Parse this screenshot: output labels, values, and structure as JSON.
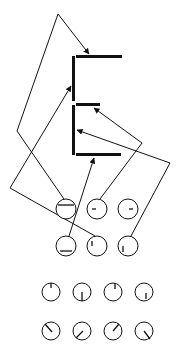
{
  "diagram": {
    "background": "#ffffff",
    "stroke_color": "#111111",
    "glyph": {
      "name": "E-shape",
      "vertical_bars": [
        {
          "x": 73.5,
          "y1": 56,
          "y2": 101
        },
        {
          "x": 73.5,
          "y1": 105,
          "y2": 155
        }
      ],
      "horizontal_bars": [
        {
          "y": 56.5,
          "x1": 76,
          "x2": 122
        },
        {
          "y": 104.5,
          "x1": 76,
          "x2": 100
        },
        {
          "y": 154.5,
          "x1": 76,
          "x2": 121
        }
      ]
    },
    "circle_rows": [
      {
        "r": 10,
        "circles": [
          {
            "cx": 66,
            "cy": 209,
            "mark": {
              "x1": 58,
              "y1": 205,
              "x2": 74,
              "y2": 205
            }
          },
          {
            "cx": 97,
            "cy": 209,
            "mark": {
              "x1": 92,
              "y1": 209,
              "x2": 96,
              "y2": 209
            }
          },
          {
            "cx": 128,
            "cy": 209,
            "mark": {
              "x1": 129,
              "y1": 209,
              "x2": 133,
              "y2": 209
            }
          }
        ]
      },
      {
        "r": 10,
        "circles": [
          {
            "cx": 66,
            "cy": 246,
            "mark": {
              "x1": 60,
              "y1": 251,
              "x2": 72,
              "y2": 251
            }
          },
          {
            "cx": 97,
            "cy": 246,
            "mark": {
              "x1": 92,
              "y1": 241,
              "x2": 92,
              "y2": 246
            }
          },
          {
            "cx": 128,
            "cy": 246,
            "mark": {
              "x1": 123,
              "y1": 246,
              "x2": 123,
              "y2": 252
            }
          }
        ]
      },
      {
        "r": 9,
        "circles": [
          {
            "cx": 51,
            "cy": 292,
            "mark": {
              "x1": 51,
              "y1": 283,
              "x2": 51,
              "y2": 288
            }
          },
          {
            "cx": 82,
            "cy": 292,
            "mark": {
              "x1": 82,
              "y1": 292,
              "x2": 82,
              "y2": 301
            }
          },
          {
            "cx": 113,
            "cy": 292,
            "mark": {
              "x1": 115,
              "y1": 283,
              "x2": 115,
              "y2": 289
            }
          },
          {
            "cx": 144,
            "cy": 292,
            "mark": {
              "x1": 146,
              "y1": 293,
              "x2": 146,
              "y2": 299
            }
          }
        ]
      },
      {
        "r": 9,
        "circles": [
          {
            "cx": 51,
            "cy": 331,
            "mark": {
              "x1": 45,
              "y1": 324,
              "x2": 52,
              "y2": 332
            }
          },
          {
            "cx": 82,
            "cy": 331,
            "mark": {
              "x1": 83,
              "y1": 331,
              "x2": 76,
              "y2": 338
            }
          },
          {
            "cx": 113,
            "cy": 331,
            "mark": {
              "x1": 113,
              "y1": 331,
              "x2": 119,
              "y2": 324
            }
          },
          {
            "cx": 144,
            "cy": 331,
            "mark": {
              "x1": 144,
              "y1": 331,
              "x2": 150,
              "y2": 339
            }
          }
        ]
      }
    ],
    "connectors": [
      {
        "name": "connector-circle1-to-top-bar",
        "points": [
          [
            64,
            199
          ],
          [
            17,
            131
          ],
          [
            58,
            14
          ],
          [
            89,
            54
          ]
        ],
        "arrow_end": true
      },
      {
        "name": "connector-circle5-to-upper-stem",
        "points": [
          [
            95,
            236
          ],
          [
            10,
            188
          ],
          [
            71,
            86
          ]
        ],
        "arrow_end": true
      },
      {
        "name": "connector-circle4-to-bottom-bar",
        "points": [
          [
            69,
            236
          ],
          [
            94,
            158
          ]
        ],
        "arrow_end": true
      },
      {
        "name": "connector-circle2-to-middle-bar",
        "points": [
          [
            100,
            199
          ],
          [
            142,
            143
          ],
          [
            94,
            108
          ]
        ],
        "arrow_end": true
      },
      {
        "name": "connector-circle6-to-lower-stem",
        "points": [
          [
            131,
            236
          ],
          [
            170,
            163
          ],
          [
            77,
            130
          ]
        ],
        "arrow_end": true
      }
    ]
  }
}
